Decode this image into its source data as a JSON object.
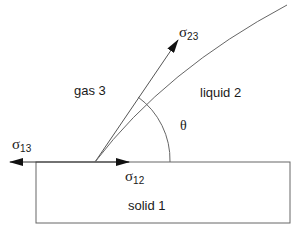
{
  "diagram": {
    "phases": {
      "solid": "solid 1",
      "liquid": "liquid 2",
      "gas": "gas 3"
    },
    "tensions": {
      "s13": {
        "symbol": "σ",
        "sub": "13"
      },
      "s12": {
        "symbol": "σ",
        "sub": "12"
      },
      "s23": {
        "symbol": "σ",
        "sub": "23"
      }
    },
    "angle_label": "θ",
    "colors": {
      "line": "#555555",
      "arrow": "#111111",
      "text": "#1a1a1a",
      "background": "#ffffff"
    }
  }
}
